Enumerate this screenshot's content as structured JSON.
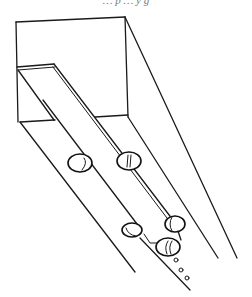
{
  "figure": {
    "caption_partial": "… p … y g",
    "stroke_color": "#1a1a1a",
    "background": "#ffffff",
    "ovals": [
      {
        "id": "oval-left-upper",
        "cx": 80,
        "cy": 163,
        "rx": 12,
        "ry": 9
      },
      {
        "id": "oval-rail-upper",
        "cx": 129,
        "cy": 161,
        "rx": 12,
        "ry": 9
      },
      {
        "id": "oval-left-lower",
        "cx": 133,
        "cy": 231,
        "rx": 10,
        "ry": 7
      },
      {
        "id": "oval-rail-lower",
        "cx": 175,
        "cy": 225,
        "rx": 10,
        "ry": 8
      },
      {
        "id": "oval-bottom",
        "cx": 168,
        "cy": 247,
        "rx": 12,
        "ry": 9
      }
    ],
    "dots": [
      {
        "cx": 176,
        "cy": 260
      },
      {
        "cx": 181,
        "cy": 270
      },
      {
        "cx": 187,
        "cy": 278
      }
    ]
  }
}
